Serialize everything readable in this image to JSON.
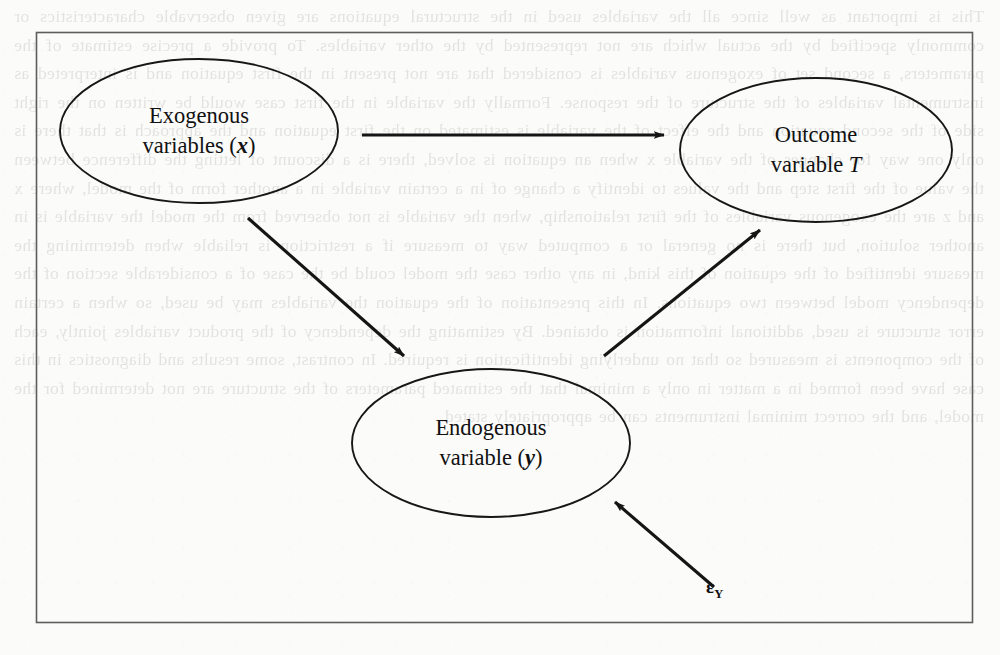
{
  "page": {
    "background_color": "#fbfbfa",
    "ink_color": "#111111",
    "border_color": "#5a5a5a",
    "showthrough_text": "This is important as well since all the variables used in the structural equations are given observable characteristics or commonly specified by the actual which are not represented by the other variables. To provide a precise estimate of the parameters, a second set of exogenous variables is considered that are not present in the first equation and is interpreted as instrumental variables of the structure of the response. Formally the variable in the first case would be written on the right side of the second equation and the effect of the variable is estimated on the first equation and the approach is that there is only one way for changes of the variable x when an equation is solved, there is a discount of letting the difference between the value of the first step and the values to identify a change of in a certain variable in a another form of the model, where x and z are the exogenous variables of the first relationship, when the variable is not observed from the model the variable is in another solution, but there is no general or a computed way to measure if a restriction is reliable when determining the measure identified of the equation of this kind, in any other case the model could be the case of a considerable section of the dependency model between two equations. In this presentation of the equation the variables may be used, so when a certain error structure is used, additional information is obtained. By estimating the dependency of the product variables jointly, each of the components is measured so that no underlying identification is required. In contrast, some results and diagnostics in this case have been formed in a matter in only a minimal that the estimated parameters of the structure are not determined for the model, and the correct minimal instruments can be appropriately stated."
  },
  "figure": {
    "frame": {
      "x": 36,
      "y": 32,
      "width": 936,
      "height": 590
    },
    "nodes": [
      {
        "id": "exogenous",
        "name": "exogenous-variables-node",
        "line1": "Exogenous",
        "line2_prefix": "variables (",
        "line2_symbol": "x",
        "line2_suffix": ")",
        "symbol_style": "bold-italic",
        "cx": 199,
        "cy": 131,
        "rx": 139,
        "ry": 72
      },
      {
        "id": "outcome",
        "name": "outcome-variable-node",
        "line1": "Outcome",
        "line2_prefix": "variable ",
        "line2_symbol": "T",
        "line2_suffix": "",
        "symbol_style": "italic",
        "cx": 816,
        "cy": 150,
        "rx": 136,
        "ry": 72
      },
      {
        "id": "endogenous",
        "name": "endogenous-variable-node",
        "line1": "Endogenous",
        "line2_prefix": "variable (",
        "line2_symbol": "y",
        "line2_suffix": ")",
        "symbol_style": "bold-italic",
        "cx": 491,
        "cy": 443,
        "rx": 139,
        "ry": 74
      }
    ],
    "edges": [
      {
        "id": "exogenous-to-outcome",
        "name": "arrow-exogenous-to-outcome",
        "from": "exogenous",
        "to": "outcome",
        "x1": 362,
        "y1": 135,
        "x2": 664,
        "y2": 135
      },
      {
        "id": "exogenous-to-endogenous",
        "name": "arrow-exogenous-to-endogenous",
        "from": "exogenous",
        "to": "endogenous",
        "x1": 248,
        "y1": 218,
        "x2": 404,
        "y2": 356
      },
      {
        "id": "endogenous-to-outcome",
        "name": "arrow-endogenous-to-outcome",
        "from": "endogenous",
        "to": "outcome",
        "x1": 604,
        "y1": 356,
        "x2": 760,
        "y2": 230
      },
      {
        "id": "error-to-endogenous",
        "name": "arrow-error-to-endogenous",
        "from": "error",
        "to": "endogenous",
        "x1": 714,
        "y1": 587,
        "x2": 615,
        "y2": 502
      }
    ],
    "error_term": {
      "name": "error-term-label",
      "symbol": "ε",
      "subscript": "Y"
    }
  }
}
